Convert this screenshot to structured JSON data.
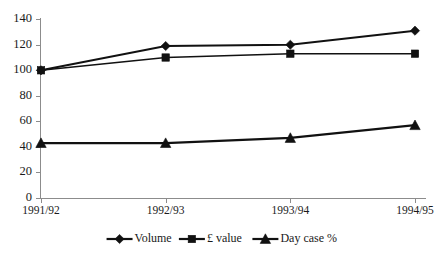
{
  "chart_data": {
    "type": "line",
    "title": "",
    "subtitle": "",
    "xlabel": "",
    "ylabel": "",
    "categories": [
      "1991/92",
      "1992/93",
      "1993/94",
      "1994/95"
    ],
    "ylim": [
      0,
      140
    ],
    "yticks": [
      0,
      20,
      40,
      60,
      80,
      100,
      120,
      140
    ],
    "ytick_labels": [
      "0",
      "20",
      "40",
      "60",
      "80",
      "100",
      "120",
      "140"
    ],
    "grid": false,
    "legend_position": "bottom",
    "series": [
      {
        "name": "Volume",
        "marker": "diamond",
        "color": "#111111",
        "values": [
          100,
          119,
          120,
          131
        ]
      },
      {
        "name": "£ value",
        "marker": "square",
        "color": "#111111",
        "values": [
          100,
          110,
          113,
          113
        ]
      },
      {
        "name": "Day case %",
        "marker": "triangle",
        "color": "#111111",
        "values": [
          43,
          43,
          47,
          57
        ]
      }
    ]
  },
  "legend": {
    "items": [
      {
        "label": "Volume",
        "marker": "diamond"
      },
      {
        "label": "£ value",
        "marker": "square"
      },
      {
        "label": "Day case %",
        "marker": "triangle"
      }
    ]
  },
  "axes": {
    "y_tick_labels": [
      "140",
      "120",
      "100",
      "80",
      "60",
      "40",
      "20",
      "0"
    ],
    "x_tick_labels": [
      "1991/92",
      "1992/93",
      "1993/94",
      "1994/95"
    ]
  }
}
